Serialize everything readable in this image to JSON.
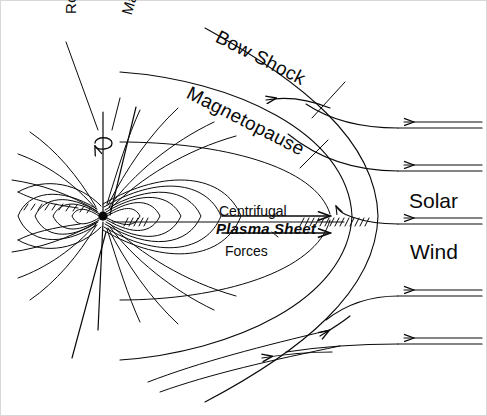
{
  "figure": {
    "kind": "magnetosphere-schematic",
    "background_color": "#ffffff",
    "ink_color": "#0a0a0a",
    "width": 487,
    "height": 416
  },
  "labels": {
    "rotation_axis": "Rotation Axis",
    "magnetic_axis": "Magnetic Axis",
    "bow_shock": "Bow Shock",
    "magnetopause": "Magnetopause",
    "solar": "Solar",
    "wind": "Wind",
    "centrifugal": "Centrifugal",
    "forces": "Forces",
    "plasma_sheet": "Plasma Sheet"
  },
  "diagram_elements": {
    "planet": "filled circle at dipole center",
    "dipole_field_lines": "nested closed loops around planet, open lines drawn sunward and tailward",
    "bow_shock_curve": "outer arc bowing to the right of the planet",
    "magnetopause_curve": "inner arc nested inside bow shock",
    "plasma_sheet": "hatched horizontal band extending tailward and sunward of planet",
    "centrifugal_force_arrows": "two rightward arrows flanking the plasma sheet label",
    "solar_wind_streamlines": "five leftward double-line arrows entering from the right edge",
    "rotation_spin_arrow": "small curved arrow encircling the rotation axis",
    "tail_hatching": "short slanted tick marks along the left-hand tail boundary"
  }
}
